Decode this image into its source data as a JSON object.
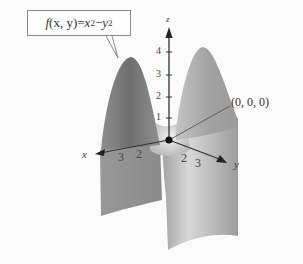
{
  "figure": {
    "function_label": {
      "f": "f",
      "args": "(x, y)",
      "equals": " = ",
      "x": "x",
      "minus": " − ",
      "y": "y",
      "exp": "2"
    },
    "origin_label": "(0, 0, 0)",
    "axes": {
      "z": {
        "name": "z",
        "ticks": [
          "1",
          "2",
          "3",
          "4"
        ]
      },
      "x": {
        "name": "x",
        "ticks": [
          "3",
          "2"
        ]
      },
      "y": {
        "name": "y",
        "ticks": [
          "2",
          "3"
        ]
      }
    },
    "colors": {
      "background": "#fbfbfb",
      "left_peak": "#7e7e7e",
      "right_peak": "#a9a9a9",
      "sheet_left": "#9a9a9a",
      "sheet_right": "#b6b6b6",
      "axis": "#333333",
      "origin_dot": "#111111"
    }
  }
}
